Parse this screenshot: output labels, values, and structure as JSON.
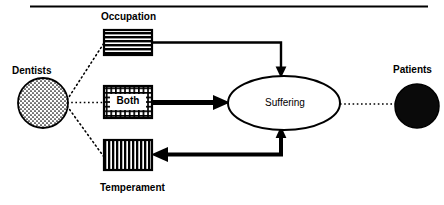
{
  "figure": {
    "top_rule": true,
    "background_color": "#ffffff",
    "ink_color": "#000000"
  },
  "nodes": {
    "dentists": {
      "label": "Dentists",
      "shape": "circle",
      "fill": "stipple-dots",
      "cx": 43,
      "cy": 103,
      "r": 25
    },
    "patients": {
      "label": "Patients",
      "shape": "circle",
      "fill": "solid-black",
      "cx": 417,
      "cy": 106,
      "r": 22
    },
    "suffering": {
      "label": "Suffering",
      "shape": "ellipse",
      "fill": "white",
      "cx": 284,
      "cy": 103,
      "rx": 56,
      "ry": 27
    },
    "occupation": {
      "label": "Occupation",
      "shape": "rect",
      "fill": "horizontal-stripes",
      "x": 104,
      "y": 30,
      "width": 48,
      "height": 25
    },
    "both": {
      "label": "Both",
      "shape": "rect",
      "fill": "cross-hatch-grid",
      "x": 104,
      "y": 86,
      "width": 48,
      "height": 32
    },
    "temperament": {
      "label": "Temperament",
      "shape": "rect",
      "fill": "vertical-stripes",
      "x": 104,
      "y": 140,
      "width": 48,
      "height": 30
    }
  },
  "edges": [
    {
      "name": "dentists-to-occupation",
      "from": "dentists",
      "to": "occupation",
      "style": "dotted",
      "arrowhead": "none",
      "weight": "thin"
    },
    {
      "name": "dentists-to-both",
      "from": "dentists",
      "to": "both",
      "style": "dotted",
      "arrowhead": "none",
      "weight": "thin"
    },
    {
      "name": "dentists-to-temperament",
      "from": "dentists",
      "to": "temperament",
      "style": "dotted",
      "arrowhead": "none",
      "weight": "thin"
    },
    {
      "name": "occupation-to-suffering",
      "from": "occupation",
      "to": "suffering",
      "style": "solid",
      "arrowhead": "down",
      "weight": "medium",
      "route": "right-then-down"
    },
    {
      "name": "both-to-suffering",
      "from": "both",
      "to": "suffering",
      "style": "solid",
      "arrowhead": "right",
      "weight": "thick",
      "route": "straight"
    },
    {
      "name": "suffering-to-temperament",
      "from": "suffering",
      "to": "temperament",
      "style": "solid",
      "arrowhead": "left",
      "weight": "thick",
      "route": "down-then-left"
    },
    {
      "name": "suffering-to-patients",
      "from": "suffering",
      "to": "patients",
      "style": "dotted",
      "arrowhead": "none",
      "weight": "thin"
    }
  ]
}
